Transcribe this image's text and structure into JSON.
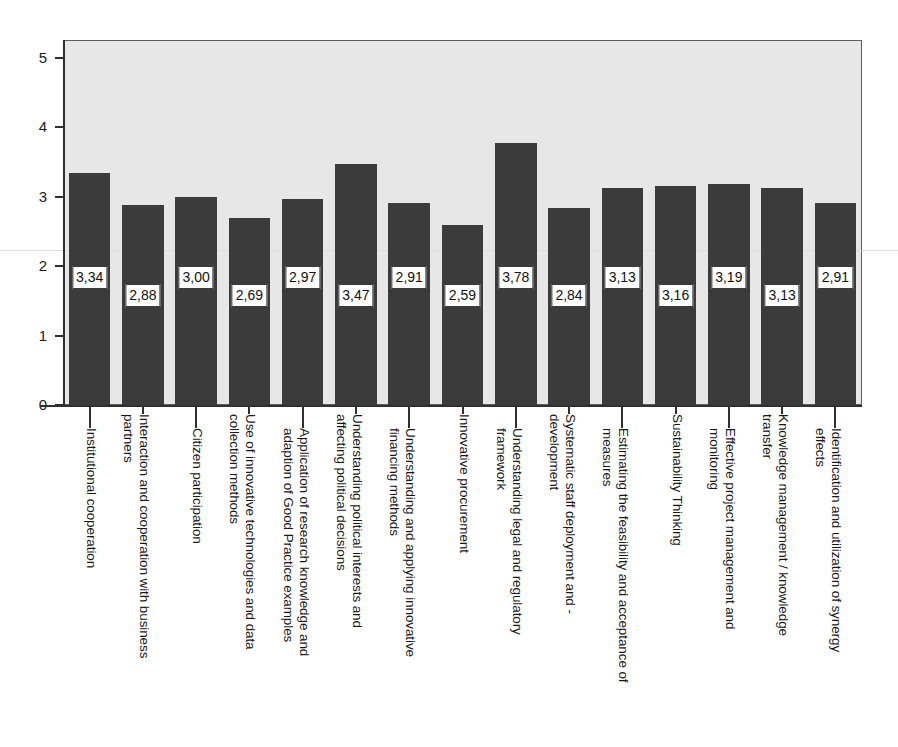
{
  "chart_data": {
    "type": "bar",
    "title": "",
    "subtitle": "",
    "xlabel": "",
    "ylabel": "",
    "ylim": [
      0,
      5
    ],
    "ytick_labels": [
      "5",
      "4",
      "3",
      "2",
      "1",
      "0"
    ],
    "yticks": [
      5,
      4,
      3,
      2,
      1,
      0
    ],
    "grid": false,
    "legend": null,
    "decimal_separator": ",",
    "bar_color": "#3b3b3b",
    "plot_background": "#e7e7e7",
    "label_box_background": "#ffffff",
    "axis_color": "#2f2f2f",
    "categories": [
      "Institutional cooperation",
      "Interaction and cooperation with business partners",
      "Citizen participation",
      "Use of innovative technologies and data collection methods",
      "Application of research knowledge and adaption of Good Practice examples",
      "Understanding political interests and affecting political decisions",
      "Understanding and applying innovative financing methods",
      "Innovative procurement",
      "Understanding legal and regulatory framework",
      "Systematic staff deployment and -development",
      "Estimating the feasibility and acceptance of measures",
      "Sustainability Thinking",
      "Effective project management and monitoring",
      "Knowledge management / knowledge transfer",
      "Identification and utilization of synergy effects"
    ],
    "category_lines": [
      [
        "Institutional cooperation"
      ],
      [
        "Interaction and cooperation with business",
        "partners"
      ],
      [
        "Citizen participation"
      ],
      [
        "Use of innovative technologies and data",
        "collection methods"
      ],
      [
        "Application of research knowledge and",
        "adaption of Good Practice examples"
      ],
      [
        "Understanding political interests and",
        "affecting political decisions"
      ],
      [
        "Understanding and applying innovative",
        "financing methods"
      ],
      [
        "Innovative procurement"
      ],
      [
        "Understanding legal and regulatory",
        "framework"
      ],
      [
        "Systematic staff deployment and -",
        "development"
      ],
      [
        "Estimating the feasibility and acceptance of",
        "measures"
      ],
      [
        "Sustainability Thinking"
      ],
      [
        "Effective project management and",
        "monitoring"
      ],
      [
        "Knowledge management / knowledge",
        "transfer"
      ],
      [
        "Identification and utilization of synergy",
        "effects"
      ]
    ],
    "values": [
      3.34,
      2.88,
      3.0,
      2.69,
      2.97,
      3.47,
      2.91,
      2.59,
      3.78,
      2.84,
      3.13,
      3.16,
      3.19,
      3.13,
      2.91
    ],
    "value_labels": [
      "3,34",
      "2,88",
      "3,00",
      "2,69",
      "2,97",
      "3,47",
      "2,91",
      "2,59",
      "3,78",
      "2,84",
      "3,13",
      "3,16",
      "3,19",
      "3,13",
      "2,91"
    ]
  }
}
